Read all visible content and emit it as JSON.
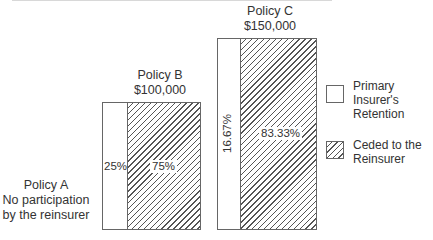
{
  "policies": [
    {
      "name": "Policy A",
      "note_line1": "No participation",
      "note_line2": "by the reinsurer"
    },
    {
      "name": "Policy B",
      "amount": "$100,000",
      "retention_pct": "25%",
      "ceded_pct": "75%"
    },
    {
      "name": "Policy C",
      "amount": "$150,000",
      "retention_pct": "16.67%",
      "ceded_pct": "83.33%"
    }
  ],
  "legend": {
    "retention_line1": "Primary Insurer's",
    "retention_line2": "Retention",
    "ceded_line1": "Ceded to the",
    "ceded_line2": "Reinsurer"
  },
  "colors": {
    "border": "#666666",
    "hatch": "#555555",
    "text": "#333333"
  }
}
